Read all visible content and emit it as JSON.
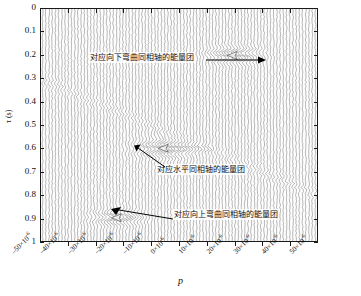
{
  "chart_data": {
    "type": "line",
    "title": "",
    "xlabel": "p",
    "ylabel": "τ (s)",
    "x_tick_labels": [
      "-50×10",
      "-40×10",
      "-30×10",
      "-20×10",
      "-10×10",
      "0×10",
      "10×10",
      "20×10",
      "30×10",
      "40×10",
      "50×10"
    ],
    "x_tick_exponent": "-6",
    "x_tick_values": [
      -5e-05,
      -4e-05,
      -3e-05,
      -2e-05,
      -1e-05,
      0,
      1e-05,
      2e-05,
      3e-05,
      4e-05,
      5e-05
    ],
    "xlim": [
      -5e-05,
      5e-05
    ],
    "y_tick_labels": [
      "0",
      "0.1",
      "0.2",
      "0.3",
      "0.4",
      "0.5",
      "0.6",
      "0.7",
      "0.8",
      "0.9",
      "1"
    ],
    "y_tick_values": [
      0,
      0.1,
      0.2,
      0.3,
      0.4,
      0.5,
      0.6,
      0.7,
      0.8,
      0.9,
      1
    ],
    "ylim": [
      0,
      1
    ],
    "y_axis_inverted": true,
    "grid": false,
    "legend": "none",
    "plot_description": "tau-p (Radon) domain wiggle-trace seismic panel: densely packed vertical variable-area traces with three localized energy concentrations",
    "energy_blobs": [
      {
        "label": "downward-curving-event",
        "p": 2e-05,
        "tau": 0.2
      },
      {
        "label": "horizontal-event",
        "p": -5e-06,
        "tau": 0.6
      },
      {
        "label": "upward-curving-event",
        "p": -2.2e-05,
        "tau": 0.9
      }
    ],
    "annotations": [
      {
        "id": "anno-down-curving",
        "text": "对应向下弯曲同相轴的能量团",
        "arrow_direction": "right",
        "points_to": {
          "p": 2e-05,
          "tau": 0.2
        }
      },
      {
        "id": "anno-horizontal",
        "text": "对应水平同相轴的能量团",
        "arrow_direction": "upper-left",
        "points_to": {
          "p": -5e-06,
          "tau": 0.61
        }
      },
      {
        "id": "anno-up-curving",
        "text": "对应向上弯曲同相轴的能量团",
        "arrow_direction": "left",
        "points_to": {
          "p": -2.2e-05,
          "tau": 0.9
        }
      }
    ]
  },
  "axis": {
    "y_label": "τ (s)",
    "x_label": "p"
  }
}
